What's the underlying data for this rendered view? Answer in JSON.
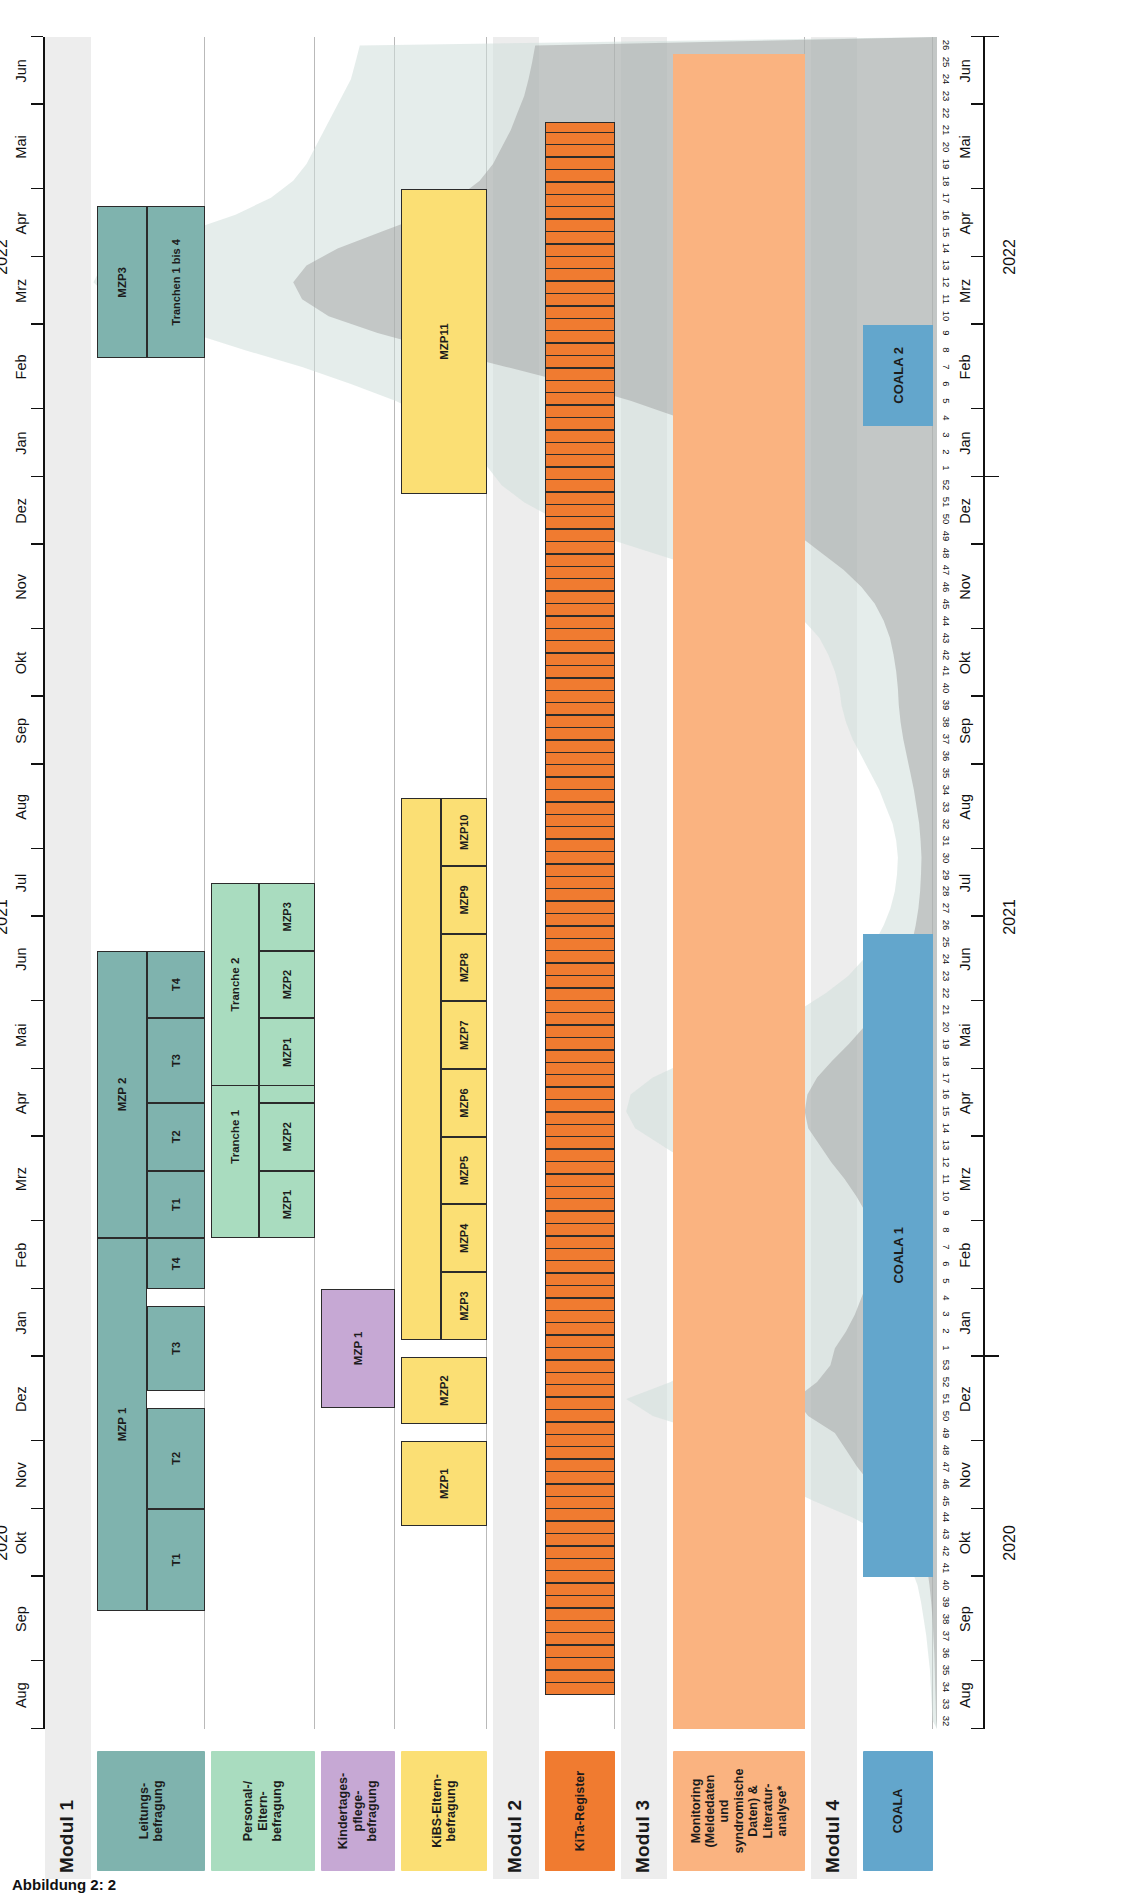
{
  "figure": {
    "caption": "Abbildung 2: 2",
    "orientation_note": "rotated",
    "time_axis": {
      "years": [
        {
          "label": "2020",
          "start_week_abs": 0,
          "end_week_abs": 21
        },
        {
          "label": "2021",
          "start_week_abs": 22,
          "end_week_abs": 73
        },
        {
          "label": "2022",
          "start_week_abs": 74,
          "end_week_abs": 99
        }
      ],
      "months": [
        "Aug",
        "Sep",
        "Okt",
        "Nov",
        "Dez",
        "Jan",
        "Feb",
        "Mrz",
        "Apr",
        "Mai",
        "Jun",
        "Jul",
        "Aug",
        "Sep",
        "Okt",
        "Nov",
        "Dez",
        "Jan",
        "Feb",
        "Mrz",
        "Apr",
        "Mai",
        "Jun"
      ],
      "week_numbers": [
        32,
        33,
        34,
        35,
        36,
        37,
        38,
        39,
        40,
        41,
        42,
        43,
        44,
        45,
        46,
        47,
        48,
        49,
        50,
        51,
        52,
        53,
        1,
        2,
        3,
        4,
        5,
        6,
        7,
        8,
        9,
        10,
        11,
        12,
        13,
        14,
        15,
        16,
        17,
        18,
        19,
        20,
        21,
        22,
        23,
        24,
        25,
        26,
        27,
        28,
        29,
        30,
        31,
        32,
        33,
        34,
        35,
        36,
        37,
        38,
        39,
        40,
        41,
        42,
        43,
        44,
        45,
        46,
        47,
        48,
        49,
        50,
        51,
        52,
        1,
        2,
        3,
        4,
        5,
        6,
        7,
        8,
        9,
        10,
        11,
        12,
        13,
        14,
        15,
        16,
        17,
        18,
        19,
        20,
        21,
        22,
        23,
        24,
        25,
        26
      ]
    },
    "value_axis": {
      "ticks": [
        "0",
        "200",
        "400",
        "600",
        "800",
        "1.000",
        "1.200",
        "1.400",
        "1.600",
        "1.800",
        "2.000"
      ],
      "min": 0,
      "max": 2000
    }
  },
  "modules": [
    {
      "id": "modul1",
      "title": "Modul 1",
      "rows": [
        {
          "id": "leitungsbefragung",
          "label": "Leitungs-\nbefragung",
          "color": "#7fb3ae",
          "bars": [
            {
              "label": "MZP 1",
              "start_week_abs": 7,
              "end_week_abs": 29,
              "segments": [
                {
                  "label": "T1",
                  "start_week_abs": 7,
                  "end_week_abs": 13
                },
                {
                  "label": "T2",
                  "start_week_abs": 13,
                  "end_week_abs": 19
                },
                {
                  "label": "T3",
                  "start_week_abs": 20,
                  "end_week_abs": 25
                },
                {
                  "label": "T4",
                  "start_week_abs": 26,
                  "end_week_abs": 29
                }
              ]
            },
            {
              "label": "MZP 2",
              "start_week_abs": 29,
              "end_week_abs": 46,
              "segments": [
                {
                  "label": "T1",
                  "start_week_abs": 29,
                  "end_week_abs": 33
                },
                {
                  "label": "T2",
                  "start_week_abs": 33,
                  "end_week_abs": 37
                },
                {
                  "label": "T3",
                  "start_week_abs": 37,
                  "end_week_abs": 42
                },
                {
                  "label": "T4",
                  "start_week_abs": 42,
                  "end_week_abs": 46
                }
              ]
            },
            {
              "label": "MZP3",
              "start_week_abs": 81,
              "end_week_abs": 90,
              "segments": [
                {
                  "label": "Tranchen 1 bis 4",
                  "start_week_abs": 81,
                  "end_week_abs": 90
                }
              ]
            }
          ]
        },
        {
          "id": "personal-elternbefragung",
          "label": "Personal-/\nEltern-\nbefragung",
          "color": "#a9dcbf",
          "bars": [
            {
              "label": "Tranche 1",
              "start_week_abs": 29,
              "end_week_abs": 41,
              "segments": [
                {
                  "label": "MZP1",
                  "start_week_abs": 29,
                  "end_week_abs": 33
                },
                {
                  "label": "MZP2",
                  "start_week_abs": 33,
                  "end_week_abs": 37
                },
                {
                  "label": "MZP3",
                  "start_week_abs": 37,
                  "end_week_abs": 41
                }
              ]
            },
            {
              "label": "Tranche 2",
              "start_week_abs": 38,
              "end_week_abs": 50,
              "segments": [
                {
                  "label": "MZP1",
                  "start_week_abs": 38,
                  "end_week_abs": 42
                },
                {
                  "label": "MZP2",
                  "start_week_abs": 42,
                  "end_week_abs": 46
                },
                {
                  "label": "MZP3",
                  "start_week_abs": 46,
                  "end_week_abs": 50
                }
              ]
            }
          ]
        },
        {
          "id": "kindertagespflegebefragung",
          "label": "Kindertages-\npflege-\nbefragung",
          "color": "#c6a8d4",
          "bars": [
            {
              "label": "MZP 1",
              "start_week_abs": 19,
              "end_week_abs": 26,
              "segments": []
            }
          ]
        },
        {
          "id": "kibs-elternbefragung",
          "label": "KiBS-Eltern-\nbefragung",
          "color": "#fbdf74",
          "bars": [
            {
              "label": "MZP1",
              "start_week_abs": 12,
              "end_week_abs": 17,
              "segments": []
            },
            {
              "label": "MZP2",
              "start_week_abs": 18,
              "end_week_abs": 22,
              "segments": []
            },
            {
              "label": "",
              "start_week_abs": 23,
              "end_week_abs": 55,
              "segments": [
                {
                  "label": "MZP3",
                  "start_week_abs": 23,
                  "end_week_abs": 27
                },
                {
                  "label": "MZP4",
                  "start_week_abs": 27,
                  "end_week_abs": 31
                },
                {
                  "label": "MZP5",
                  "start_week_abs": 31,
                  "end_week_abs": 35
                },
                {
                  "label": "MZP6",
                  "start_week_abs": 35,
                  "end_week_abs": 39
                },
                {
                  "label": "MZP7",
                  "start_week_abs": 39,
                  "end_week_abs": 43
                },
                {
                  "label": "MZP8",
                  "start_week_abs": 43,
                  "end_week_abs": 47
                },
                {
                  "label": "MZP9",
                  "start_week_abs": 47,
                  "end_week_abs": 51
                },
                {
                  "label": "MZP10",
                  "start_week_abs": 51,
                  "end_week_abs": 55
                }
              ]
            },
            {
              "label": "MZP11",
              "start_week_abs": 73,
              "end_week_abs": 91,
              "segments": []
            }
          ]
        }
      ]
    },
    {
      "id": "modul2",
      "title": "Modul 2",
      "rows": [
        {
          "id": "kita-register",
          "label": "KiTa-Register",
          "color": "#f07b30",
          "bars": [
            {
              "label": "",
              "start_week_abs": 2,
              "end_week_abs": 95,
              "striped": true,
              "segments": []
            }
          ]
        }
      ]
    },
    {
      "id": "modul3",
      "title": "Modul 3",
      "rows": [
        {
          "id": "monitoring",
          "label": "Monitoring\n(Meldedaten\nund\nsyndromische\nDaten) &\nLiteratur-\nanalyse*",
          "color": "#fab380",
          "bars": [
            {
              "label": "",
              "start_week_abs": 0,
              "end_week_abs": 99,
              "soft": true,
              "segments": []
            }
          ]
        }
      ]
    },
    {
      "id": "modul4",
      "title": "Modul 4",
      "rows": [
        {
          "id": "coala",
          "label": "COALA",
          "color": "#63a6cc",
          "bars": [
            {
              "label": "COALA 1",
              "start_week_abs": 9,
              "end_week_abs": 47,
              "soft": true,
              "segments": []
            },
            {
              "label": "COALA 2",
              "start_week_abs": 77,
              "end_week_abs": 83,
              "soft": true,
              "segments": []
            }
          ]
        }
      ]
    }
  ],
  "chart_data": {
    "type": "area",
    "title": "",
    "xlabel": "",
    "ylabel": "",
    "ylim": [
      0,
      2000
    ],
    "grid": true,
    "legend": "none",
    "note": "7-Tage-Inzidenzkurve im Hintergrund (zwei ueberlagerte Flaechen: hellgruen-grau und dunkelgrau)",
    "x": [
      32,
      33,
      34,
      35,
      36,
      37,
      38,
      39,
      40,
      41,
      42,
      43,
      44,
      45,
      46,
      47,
      48,
      49,
      50,
      51,
      52,
      53,
      1,
      2,
      3,
      4,
      5,
      6,
      7,
      8,
      9,
      10,
      11,
      12,
      13,
      14,
      15,
      16,
      17,
      18,
      19,
      20,
      21,
      22,
      23,
      24,
      25,
      26,
      27,
      28,
      29,
      30,
      31,
      32,
      33,
      34,
      35,
      36,
      37,
      38,
      39,
      40,
      41,
      42,
      43,
      44,
      45,
      46,
      47,
      48,
      49,
      50,
      51,
      52,
      1,
      2,
      3,
      4,
      5,
      6,
      7,
      8,
      9,
      10,
      11,
      12,
      13,
      14,
      15,
      16,
      17,
      18,
      19,
      20,
      21,
      22,
      23,
      24,
      25,
      26
    ],
    "series": [
      {
        "name": "Gesamtbevoelkerung",
        "color": "#cfdedb",
        "values": [
          10,
          12,
          14,
          16,
          20,
          24,
          30,
          36,
          44,
          58,
          80,
          120,
          190,
          280,
          360,
          420,
          470,
          520,
          640,
          700,
          600,
          540,
          520,
          470,
          430,
          400,
          370,
          340,
          330,
          340,
          380,
          430,
          490,
          560,
          620,
          680,
          700,
          690,
          640,
          560,
          470,
          390,
          310,
          250,
          200,
          165,
          140,
          120,
          105,
          95,
          90,
          88,
          92,
          100,
          115,
          130,
          150,
          170,
          190,
          205,
          215,
          220,
          230,
          245,
          265,
          300,
          350,
          420,
          520,
          640,
          760,
          860,
          930,
          980,
          1010,
          1040,
          1080,
          1140,
          1220,
          1320,
          1430,
          1560,
          1680,
          1790,
          1860,
          1900,
          1880,
          1800,
          1690,
          1580,
          1500,
          1450,
          1420,
          1400,
          1380,
          1360,
          1340,
          1320,
          1310,
          1300
        ]
      },
      {
        "name": "Kinder / Kita-Altersgruppe",
        "color": "#9a9a9a",
        "values": [
          2,
          3,
          4,
          5,
          6,
          8,
          10,
          13,
          17,
          22,
          30,
          46,
          74,
          110,
          150,
          180,
          205,
          230,
          290,
          320,
          270,
          240,
          230,
          205,
          185,
          170,
          155,
          142,
          138,
          142,
          160,
          182,
          208,
          238,
          264,
          290,
          298,
          292,
          270,
          236,
          198,
          164,
          130,
          104,
          82,
          68,
          56,
          48,
          42,
          38,
          36,
          35,
          37,
          40,
          46,
          52,
          60,
          68,
          76,
          82,
          86,
          88,
          92,
          98,
          106,
          120,
          140,
          170,
          210,
          260,
          310,
          350,
          380,
          400,
          420,
          450,
          500,
          580,
          690,
          820,
          970,
          1120,
          1260,
          1370,
          1430,
          1450,
          1420,
          1350,
          1250,
          1150,
          1080,
          1030,
          1000,
          980,
          960,
          945,
          930,
          920,
          912,
          905
        ]
      }
    ]
  }
}
